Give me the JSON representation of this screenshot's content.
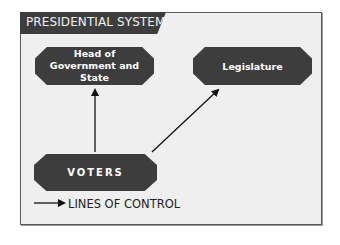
{
  "title": "PRESIDENTIAL SYSTEMS",
  "nodes": {
    "head": "Head of Government and State",
    "legislature": "Legislature",
    "voters": "VOTERS"
  },
  "legend": {
    "label": "LINES OF CONTROL",
    "icon": "arrow-right-icon"
  },
  "edges": [
    {
      "from": "voters",
      "to": "head"
    },
    {
      "from": "voters",
      "to": "legislature"
    }
  ],
  "colors": {
    "node_fill": "#3d3d3d",
    "background": "#efefef",
    "border": "#5a5a5a"
  }
}
